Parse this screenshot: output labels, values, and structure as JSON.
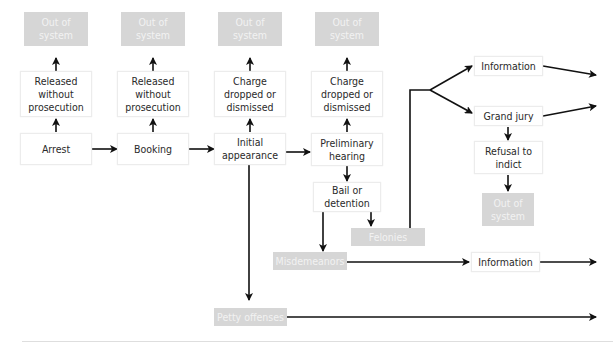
{
  "diagram": {
    "type": "flowchart",
    "nodes": {
      "out_arrest": "Out of system",
      "released_arrest": "Released without prosecution",
      "arrest": "Arrest",
      "out_booking": "Out of system",
      "released_booking": "Released without prosecution",
      "booking": "Booking",
      "out_initial": "Out of system",
      "charge_initial": "Charge dropped or dismissed",
      "initial_appearance": "Initial appearance",
      "out_prelim": "Out of system",
      "charge_prelim": "Charge dropped or dismissed",
      "preliminary_hearing": "Preliminary hearing",
      "bail": "Bail or detention",
      "felonies": "Felonies",
      "misdemeanors": "Misdemeanors",
      "petty_offenses": "Petty offenses",
      "information_felony": "Information",
      "grand_jury": "Grand jury",
      "refusal": "Refusal to indict",
      "out_refusal": "Out of system",
      "information_misd": "Information"
    },
    "edges": [
      [
        "Arrest",
        "Booking"
      ],
      [
        "Arrest",
        "Released without prosecution"
      ],
      [
        "Released without prosecution",
        "Out of system"
      ],
      [
        "Booking",
        "Initial appearance"
      ],
      [
        "Booking",
        "Released without prosecution"
      ],
      [
        "Initial appearance",
        "Preliminary hearing"
      ],
      [
        "Initial appearance",
        "Charge dropped or dismissed"
      ],
      [
        "Initial appearance",
        "Petty offenses"
      ],
      [
        "Preliminary hearing",
        "Charge dropped or dismissed"
      ],
      [
        "Preliminary hearing",
        "Bail or detention"
      ],
      [
        "Bail or detention",
        "Felonies"
      ],
      [
        "Bail or detention",
        "Misdemeanors"
      ],
      [
        "Felonies",
        "Information"
      ],
      [
        "Felonies",
        "Grand jury"
      ],
      [
        "Grand jury",
        "Refusal to indict"
      ],
      [
        "Refusal to indict",
        "Out of system"
      ],
      [
        "Misdemeanors",
        "Information"
      ]
    ]
  }
}
